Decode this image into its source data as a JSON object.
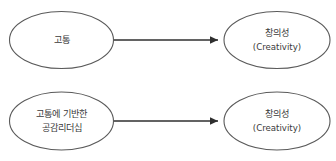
{
  "diagram": {
    "type": "flow-diagram",
    "background_color": "#ffffff",
    "node_border_color": "#5a5a5a",
    "node_fill_color": "#ffffff",
    "text_color": "#3a3a3a",
    "arrow_color": "#2f2f2f",
    "rows": [
      {
        "id": "row-1",
        "source": {
          "id": "node-pain",
          "lines": [
            "고통"
          ]
        },
        "target": {
          "id": "node-creativity-1",
          "lines": [
            "창의성",
            "(Creativity)"
          ]
        },
        "edge": {
          "id": "edge-1",
          "marker": "arrow-head",
          "label": ""
        }
      },
      {
        "id": "row-2",
        "source": {
          "id": "node-pain-based-empathic-leadership",
          "lines": [
            "고통에 기반한",
            "공감리더십"
          ]
        },
        "target": {
          "id": "node-creativity-2",
          "lines": [
            "창의성",
            "(Creativity)"
          ]
        },
        "edge": {
          "id": "edge-2",
          "marker": "arrow-head",
          "label": ""
        }
      }
    ]
  }
}
